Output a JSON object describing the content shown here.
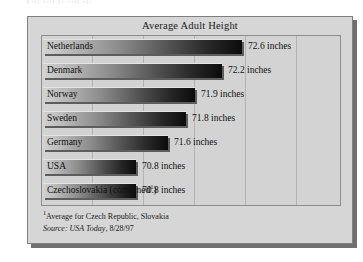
{
  "page": {
    "top_remnant_text": "1:|| |::| |: ::|| :|:"
  },
  "figure": {
    "title": "Average Adult Height",
    "footnote_mark": "1",
    "footnote_text": "Average for Czech Republic, Slovakia",
    "source_label": "Source:",
    "source_publication": "USA Today",
    "source_date": ", 8/28/97"
  },
  "chart_data": {
    "type": "bar",
    "orientation": "horizontal",
    "title": "Average Adult Height",
    "xlabel": "",
    "ylabel": "",
    "unit": "inches",
    "grid": true,
    "legend": "none",
    "xlim": [
      0,
      73.6
    ],
    "categories": [
      "Netherlands",
      "Denmark",
      "Norway",
      "Sweden",
      "Germany",
      "USA",
      "Czechoslovakia (combined¹)"
    ],
    "values": [
      72.6,
      72.2,
      71.9,
      71.8,
      71.6,
      70.8,
      70.8
    ],
    "value_labels": [
      "72.6 inches",
      "72.2 inches",
      "71.9 inches",
      "71.8 inches",
      "71.6 inches",
      "70.8 inches",
      "70.8 inches"
    ],
    "bars": [
      {
        "category": "Netherlands",
        "value": 72.6,
        "label": "72.6 inches",
        "bar_width_px": 199,
        "value_x_px": 206
      },
      {
        "category": "Denmark",
        "value": 72.2,
        "label": "72.2 inches",
        "bar_width_px": 179,
        "value_x_px": 186
      },
      {
        "category": "Norway",
        "value": 71.9,
        "label": "71.9 inches",
        "bar_width_px": 152,
        "value_x_px": 159
      },
      {
        "category": "Sweden",
        "value": 71.8,
        "label": "71.8 inches",
        "bar_width_px": 143,
        "value_x_px": 150
      },
      {
        "category": "Germany",
        "value": 71.6,
        "label": "71.6 inches",
        "bar_width_px": 125,
        "value_x_px": 132
      },
      {
        "category": "USA",
        "value": 70.8,
        "label": "70.8 inches",
        "bar_width_px": 93,
        "value_x_px": 100
      },
      {
        "category": "Czechoslovakia (combined¹)",
        "value": 70.8,
        "label": "70.8 inches",
        "bar_width_px": 93,
        "value_x_px": 100
      }
    ],
    "gridline_positions_px": [
      50,
      101,
      152,
      203,
      254
    ]
  }
}
